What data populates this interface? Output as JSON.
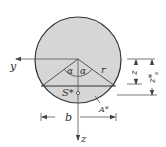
{
  "diagram": {
    "type": "circular-segment-cross-section",
    "colors": {
      "fill": "#d6d6d6",
      "stroke": "#333333",
      "axis": "#555555",
      "background": "#ffffff"
    },
    "labels": {
      "y_axis": "y",
      "z_axis": "z",
      "angle_left": "α",
      "angle_right": "α",
      "radius": "r",
      "centroid": "S*",
      "area": "A*",
      "width": "b",
      "dim_z": "z",
      "dim_zs": "z*",
      "dim_zs_sub": "s"
    }
  }
}
